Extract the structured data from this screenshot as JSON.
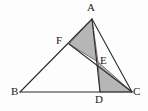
{
  "figure": {
    "type": "geometry-diagram",
    "canvas": {
      "width": 148,
      "height": 111
    },
    "background_color": "#fdfdfd",
    "stroke_color": "#2b2b2b",
    "shade_color": "#b6b6b6",
    "shade_stroke": "#555555"
  },
  "points": {
    "A": {
      "label": "A",
      "x": 92,
      "y": 19,
      "label_x": 87,
      "label_y": 2
    },
    "B": {
      "label": "B",
      "x": 20,
      "y": 92,
      "label_x": 11,
      "label_y": 86
    },
    "C": {
      "label": "C",
      "x": 132,
      "y": 92,
      "label_x": 133,
      "label_y": 86
    },
    "D": {
      "label": "D",
      "x": 100,
      "y": 92,
      "label_x": 95,
      "label_y": 94
    },
    "E": {
      "label": "E",
      "x": 98,
      "y": 62,
      "label_x": 100,
      "label_y": 55
    },
    "F": {
      "label": "F",
      "x": 69,
      "y": 44,
      "label_x": 56,
      "label_y": 35
    }
  },
  "segments": [
    {
      "name": "side-AB",
      "from": "A",
      "to": "B"
    },
    {
      "name": "side-BC",
      "from": "B",
      "to": "C"
    },
    {
      "name": "side-CA",
      "from": "C",
      "to": "A"
    },
    {
      "name": "cevian-AD",
      "from": "A",
      "to": "D"
    },
    {
      "name": "cevian-FC",
      "from": "F",
      "to": "C"
    }
  ],
  "shaded_regions": [
    {
      "name": "triangle-AFE",
      "vertices": [
        "A",
        "F",
        "E"
      ]
    },
    {
      "name": "triangle-EDC",
      "vertices": [
        "E",
        "D",
        "C"
      ]
    }
  ],
  "labels": {
    "A": "A",
    "B": "B",
    "C": "C",
    "D": "D",
    "E": "E",
    "F": "F"
  }
}
